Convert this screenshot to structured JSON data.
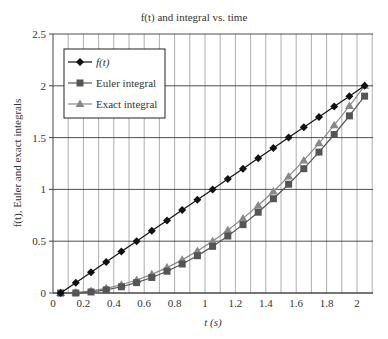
{
  "chart_data": {
    "type": "line",
    "title": "f(t) and integral vs. time",
    "xlabel": "t (s)",
    "ylabel": "f(t), Euler and exact integrals",
    "xlim": [
      0,
      2.1
    ],
    "ylim": [
      0,
      2.5
    ],
    "xticks": [
      0,
      0.2,
      0.4,
      0.6,
      0.8,
      1,
      1.2,
      1.4,
      1.6,
      1.8,
      2
    ],
    "yticks": [
      0,
      0.5,
      1,
      1.5,
      2,
      2.5
    ],
    "grid": "vertical every 0.1, horizontal every 0.5",
    "legend_position": "upper left",
    "x": [
      0.05,
      0.15,
      0.25,
      0.35,
      0.45,
      0.55,
      0.65,
      0.75,
      0.85,
      0.95,
      1.05,
      1.15,
      1.25,
      1.35,
      1.45,
      1.55,
      1.65,
      1.75,
      1.85,
      1.95,
      2.05
    ],
    "series": [
      {
        "name": "f(t)",
        "marker": "diamond",
        "color": "#111111",
        "values": [
          0,
          0.1,
          0.2,
          0.3,
          0.4,
          0.5,
          0.6,
          0.7,
          0.8,
          0.9,
          1.0,
          1.1,
          1.2,
          1.3,
          1.4,
          1.5,
          1.6,
          1.7,
          1.8,
          1.9,
          2.0
        ]
      },
      {
        "name": "Euler integral",
        "marker": "square",
        "color": "#555555",
        "values": [
          0,
          0,
          0.01,
          0.03,
          0.06,
          0.1,
          0.15,
          0.21,
          0.28,
          0.36,
          0.45,
          0.55,
          0.66,
          0.78,
          0.91,
          1.05,
          1.2,
          1.36,
          1.53,
          1.71,
          1.9
        ]
      },
      {
        "name": "Exact integral",
        "marker": "triangle",
        "color": "#888888",
        "values": [
          0,
          0.005,
          0.02,
          0.045,
          0.08,
          0.125,
          0.18,
          0.245,
          0.32,
          0.405,
          0.5,
          0.605,
          0.72,
          0.845,
          0.98,
          1.125,
          1.28,
          1.445,
          1.62,
          1.805,
          2.0
        ]
      }
    ]
  }
}
